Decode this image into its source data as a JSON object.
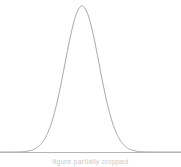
{
  "figure": {
    "background_color": "#ffffff",
    "width": 181,
    "height": 167
  },
  "axis": {
    "baseline_color": "#b5b5b5",
    "baseline_y": 152,
    "x_start": 0,
    "x_end": 181
  },
  "curve": {
    "color": "#9a9a9a",
    "stroke_width": 0.9,
    "name": "normal-distribution-curve"
  },
  "caption": {
    "text": "figure partially cropped",
    "color": "#c9c9c9"
  },
  "chart_data": {
    "type": "line",
    "title": "",
    "subtitle": "",
    "xlabel": "",
    "ylabel": "",
    "grid": false,
    "legend": null,
    "distribution": "gaussian",
    "peak_x": 82,
    "peak_y_px": 6,
    "baseline_y_px": 152,
    "sigma_px": 17,
    "xlim": [
      0,
      181
    ],
    "ylim": [
      0,
      1
    ],
    "x": [
      0,
      6,
      12,
      18,
      24,
      30,
      36,
      42,
      48,
      54,
      60,
      66,
      72,
      76,
      82,
      88,
      92,
      98,
      104,
      110,
      116,
      122,
      128,
      134,
      140,
      146,
      152,
      158,
      164,
      170,
      176,
      181
    ],
    "values": [
      0.0,
      0.001,
      0.002,
      0.004,
      0.008,
      0.015,
      0.03,
      0.06,
      0.12,
      0.26,
      0.47,
      0.72,
      0.93,
      0.99,
      1.0,
      0.97,
      0.9,
      0.71,
      0.46,
      0.25,
      0.12,
      0.055,
      0.026,
      0.013,
      0.007,
      0.004,
      0.002,
      0.001,
      0.0005,
      0.0002,
      0.0001,
      0.0
    ],
    "series": [
      {
        "name": "normal-density",
        "values": [
          0.0,
          0.001,
          0.002,
          0.004,
          0.008,
          0.015,
          0.03,
          0.06,
          0.12,
          0.26,
          0.47,
          0.72,
          0.93,
          0.99,
          1.0,
          0.97,
          0.9,
          0.71,
          0.46,
          0.25,
          0.12,
          0.055,
          0.026,
          0.013,
          0.007,
          0.004,
          0.002,
          0.001,
          0.0005,
          0.0002,
          0.0001,
          0.0
        ]
      }
    ]
  }
}
